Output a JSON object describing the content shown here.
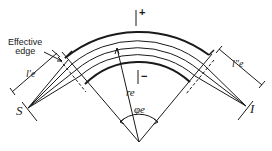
{
  "diagram": {
    "labels": {
      "effective_edge": "Effective edge",
      "effective_edge_line1": "Effective",
      "effective_edge_line2": "edge",
      "source": "S",
      "image": "I",
      "l_prime": "l′e",
      "l_double_prime": "l″e",
      "radius": "re",
      "angle": "φe",
      "plus": "+",
      "minus": "−"
    },
    "colors": {
      "stroke": "#1a1a1a",
      "background": "#ffffff"
    }
  }
}
